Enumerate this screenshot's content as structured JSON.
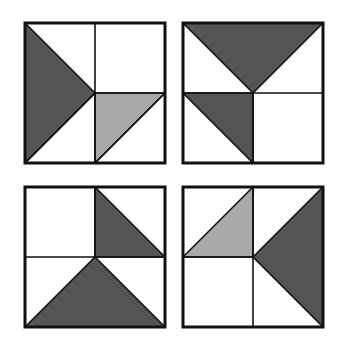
{
  "colors": {
    "background": "#ffffff",
    "stroke": "#111111",
    "dark_fill": "#555555",
    "light_fill": "#a9a9a9",
    "white_fill": "#ffffff"
  },
  "figures": [
    {
      "id": "square-1",
      "position": "top-left",
      "origin": [
        25,
        23
      ],
      "size": 140,
      "shapes": [
        {
          "type": "triangle",
          "fill": "dark",
          "points": [
            [
              0,
              0
            ],
            [
              0.5,
              0.5
            ],
            [
              0,
              1
            ]
          ]
        },
        {
          "type": "triangle",
          "fill": "light",
          "points": [
            [
              0.5,
              0.5
            ],
            [
              1,
              0.5
            ],
            [
              0.5,
              1
            ]
          ]
        }
      ],
      "lines": [
        [
          [
            0.5,
            0
          ],
          [
            0.5,
            1
          ]
        ],
        [
          [
            0.5,
            0.5
          ],
          [
            1,
            0.5
          ]
        ],
        [
          [
            0.5,
            0.5
          ],
          [
            0,
            1
          ]
        ],
        [
          [
            1,
            0.5
          ],
          [
            0.5,
            1
          ]
        ]
      ]
    },
    {
      "id": "square-2",
      "position": "top-right",
      "origin": [
        183,
        23
      ],
      "size": 140,
      "shapes": [
        {
          "type": "triangle",
          "fill": "dark",
          "points": [
            [
              0,
              0
            ],
            [
              1,
              0
            ],
            [
              0.5,
              0.5
            ]
          ]
        },
        {
          "type": "triangle",
          "fill": "dark",
          "points": [
            [
              0,
              0.5
            ],
            [
              0.5,
              0.5
            ],
            [
              0.5,
              1
            ]
          ]
        }
      ],
      "lines": [
        [
          [
            0,
            0.5
          ],
          [
            1,
            0.5
          ]
        ],
        [
          [
            0.5,
            0.5
          ],
          [
            0.5,
            1
          ]
        ]
      ]
    },
    {
      "id": "square-3",
      "position": "bottom-left",
      "origin": [
        25,
        187
      ],
      "size": 140,
      "shapes": [
        {
          "type": "triangle",
          "fill": "dark",
          "points": [
            [
              0.5,
              0
            ],
            [
              1,
              0.5
            ],
            [
              0.5,
              0.5
            ]
          ]
        },
        {
          "type": "triangle",
          "fill": "dark",
          "points": [
            [
              0,
              1
            ],
            [
              0.5,
              0.5
            ],
            [
              1,
              1
            ]
          ]
        }
      ],
      "lines": [
        [
          [
            0.5,
            0
          ],
          [
            0.5,
            0.5
          ]
        ],
        [
          [
            0,
            0.5
          ],
          [
            1,
            0.5
          ]
        ]
      ]
    },
    {
      "id": "square-4",
      "position": "bottom-right",
      "origin": [
        183,
        187
      ],
      "size": 140,
      "shapes": [
        {
          "type": "triangle",
          "fill": "light",
          "points": [
            [
              0,
              0.5
            ],
            [
              0.5,
              0
            ],
            [
              0.5,
              0.5
            ]
          ]
        },
        {
          "type": "triangle",
          "fill": "dark",
          "points": [
            [
              1,
              0
            ],
            [
              0.5,
              0.5
            ],
            [
              1,
              1
            ]
          ]
        }
      ],
      "lines": [
        [
          [
            0.5,
            0
          ],
          [
            0.5,
            1
          ]
        ],
        [
          [
            0,
            0.5
          ],
          [
            0.5,
            0.5
          ]
        ]
      ]
    }
  ]
}
